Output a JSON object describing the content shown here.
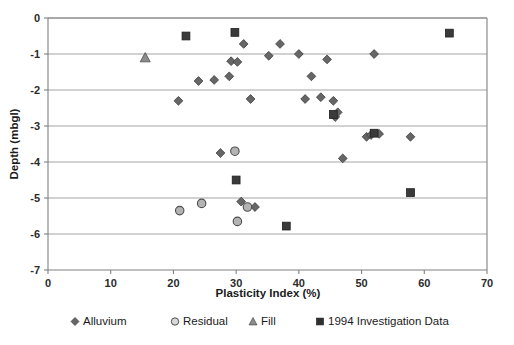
{
  "chart_data": {
    "type": "scatter",
    "title": "",
    "xlabel": "Plasticity Index (%)",
    "ylabel": "Depth (mbgl)",
    "xlim": [
      0,
      70
    ],
    "ylim": [
      -7,
      0
    ],
    "xticks": [
      0,
      10,
      20,
      30,
      40,
      50,
      60,
      70
    ],
    "yticks": [
      0,
      -1,
      -2,
      -3,
      -4,
      -5,
      -6,
      -7
    ],
    "xtick_labels": [
      "0",
      "10",
      "20",
      "30",
      "40",
      "50",
      "60",
      "70"
    ],
    "ytick_labels": [
      "0",
      "-1",
      "-2",
      "-3",
      "-4",
      "-5",
      "-6",
      "-7"
    ],
    "grid": "horizontal",
    "legend_position": "bottom",
    "series": [
      {
        "name": "Alluvium",
        "marker": "diamond",
        "color": "#666666",
        "points": [
          [
            20.8,
            -2.3
          ],
          [
            24.0,
            -1.75
          ],
          [
            26.5,
            -1.72
          ],
          [
            27.5,
            -3.75
          ],
          [
            28.9,
            -1.62
          ],
          [
            29.2,
            -1.2
          ],
          [
            30.2,
            -1.22
          ],
          [
            30.8,
            -5.1
          ],
          [
            31.2,
            -0.72
          ],
          [
            32.3,
            -2.25
          ],
          [
            33.0,
            -5.25
          ],
          [
            35.2,
            -1.05
          ],
          [
            37.0,
            -0.72
          ],
          [
            40.0,
            -1.0
          ],
          [
            41.0,
            -2.25
          ],
          [
            42.0,
            -1.62
          ],
          [
            43.5,
            -2.2
          ],
          [
            44.5,
            -1.15
          ],
          [
            45.5,
            -2.3
          ],
          [
            45.8,
            -2.75
          ],
          [
            46.2,
            -2.62
          ],
          [
            47.0,
            -3.9
          ],
          [
            50.8,
            -3.3
          ],
          [
            51.5,
            -3.25
          ],
          [
            52.0,
            -1.0
          ],
          [
            52.8,
            -3.22
          ],
          [
            57.8,
            -3.3
          ]
        ]
      },
      {
        "name": "Residual",
        "marker": "circle",
        "color": "#b3b3b3",
        "points": [
          [
            21.0,
            -5.35
          ],
          [
            24.5,
            -5.15
          ],
          [
            29.8,
            -3.7
          ],
          [
            31.8,
            -5.25
          ],
          [
            30.2,
            -5.65
          ]
        ]
      },
      {
        "name": "Fill",
        "marker": "triangle",
        "color": "#8c8c8c",
        "points": [
          [
            15.5,
            -1.1
          ]
        ]
      },
      {
        "name": "1994 Investigation Data",
        "marker": "square",
        "color": "#3a3a3a",
        "points": [
          [
            22.0,
            -0.5
          ],
          [
            29.8,
            -0.4
          ],
          [
            30.0,
            -4.5
          ],
          [
            38.0,
            -5.78
          ],
          [
            45.5,
            -2.68
          ],
          [
            52.0,
            -3.2
          ],
          [
            57.8,
            -4.85
          ],
          [
            64.0,
            -0.42
          ]
        ]
      }
    ]
  },
  "legend": {
    "items": [
      {
        "label": "Alluvium",
        "marker": "diamond"
      },
      {
        "label": "Residual",
        "marker": "circle"
      },
      {
        "label": "Fill",
        "marker": "triangle"
      },
      {
        "label": "1994 Investigation Data",
        "marker": "square"
      }
    ]
  }
}
